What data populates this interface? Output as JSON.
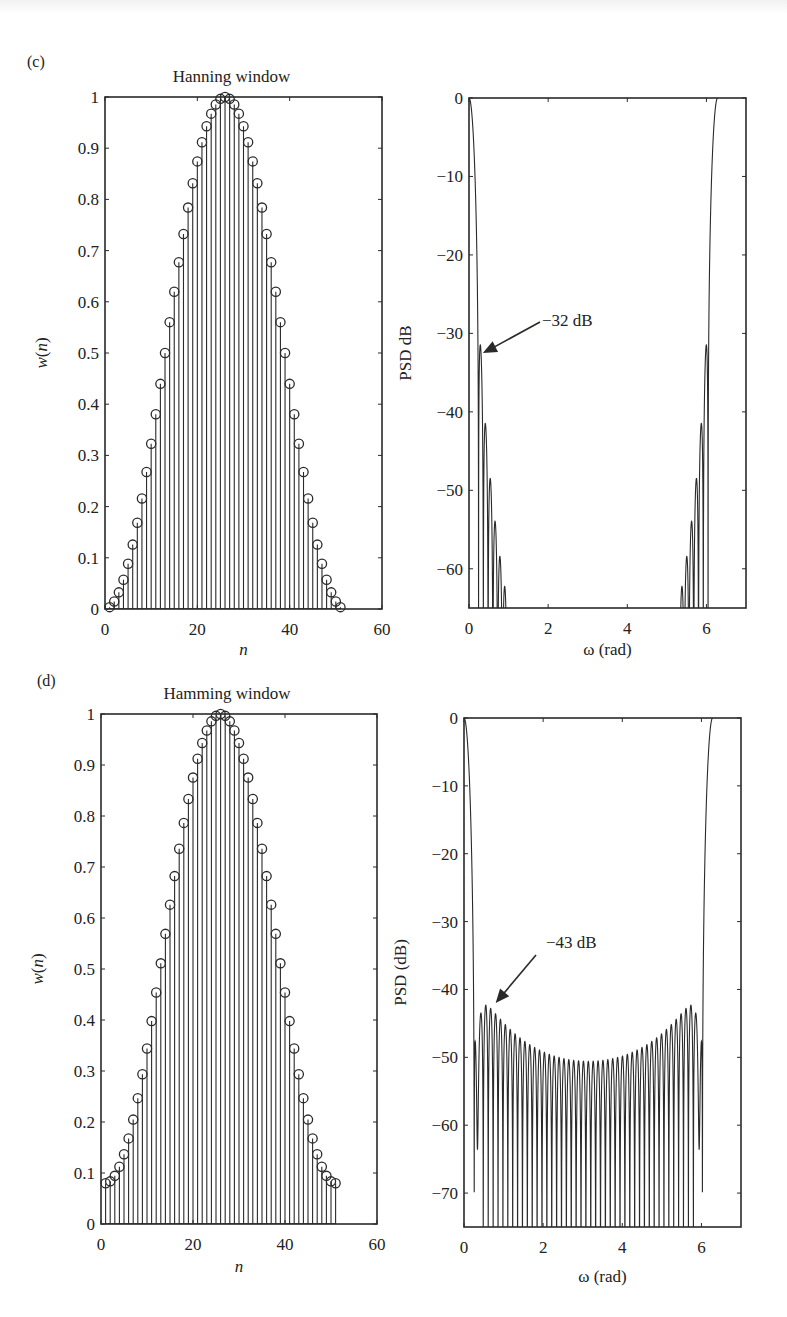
{
  "figure": {
    "panels": [
      {
        "id": "c",
        "label": "(c)"
      },
      {
        "id": "d",
        "label": "(d)"
      }
    ]
  },
  "chart_data": [
    {
      "panel": "(c)",
      "type": "stem",
      "title": "Hanning window",
      "xlabel": "n",
      "ylabel": "w(n)",
      "xlim": [
        0,
        60
      ],
      "ylim": [
        0,
        1
      ],
      "xticks": [
        0,
        20,
        40,
        60
      ],
      "yticks": [
        0,
        0.1,
        0.2,
        0.3,
        0.4,
        0.5,
        0.6,
        0.7,
        0.8,
        0.9,
        1
      ],
      "ytick_labels": [
        "0",
        "0.1",
        "0.2",
        "0.3",
        "0.4",
        "0.5",
        "0.6",
        "0.7",
        "0.8",
        "0.9",
        "1"
      ],
      "grid": false,
      "marker": "circle",
      "n_points": 51,
      "x_start": 1,
      "window": "hanning",
      "formula": "w(n) = 0.5 - 0.5*cos(2*pi*n/(N+1)), n = 1..N, N = 51",
      "peak": {
        "n": 26,
        "value": 1.0
      }
    },
    {
      "panel": "(c)",
      "type": "line",
      "title": "",
      "xlabel": "ω (rad)",
      "ylabel": "PSD dB",
      "xlim": [
        0,
        7
      ],
      "ylim": [
        -65,
        0
      ],
      "xticks": [
        0,
        2,
        4,
        6
      ],
      "yticks": [
        0,
        -10,
        -20,
        -30,
        -40,
        -50,
        -60
      ],
      "ytick_labels": [
        "0",
        "−10",
        "−20",
        "−30",
        "−40",
        "−50",
        "−60"
      ],
      "grid": false,
      "mainlobe_edges": [
        0.0,
        6.283
      ],
      "first_sidelobe_db": -32,
      "sidelobe_peaks_db": [
        -32,
        -42,
        -49,
        -54,
        -59,
        -63
      ],
      "annotation": {
        "text": "−32 dB",
        "arrow_to": [
          0.35,
          -32.5
        ]
      }
    },
    {
      "panel": "(d)",
      "type": "stem",
      "title": "Hamming window",
      "xlabel": "n",
      "ylabel": "w(n)",
      "xlim": [
        0,
        60
      ],
      "ylim": [
        0,
        1
      ],
      "xticks": [
        0,
        20,
        40,
        60
      ],
      "yticks": [
        0,
        0.1,
        0.2,
        0.3,
        0.4,
        0.5,
        0.6,
        0.7,
        0.8,
        0.9,
        1
      ],
      "ytick_labels": [
        "0",
        "0.1",
        "0.2",
        "0.3",
        "0.4",
        "0.5",
        "0.6",
        "0.7",
        "0.8",
        "0.9",
        "1"
      ],
      "grid": false,
      "marker": "circle",
      "n_points": 51,
      "x_start": 1,
      "window": "hamming",
      "formula": "w(n) = 0.54 - 0.46*cos(2*pi*(n-1)/(N-1)), n = 1..N, N = 51",
      "endpoint_value": 0.08,
      "peak": {
        "n": 26,
        "value": 1.0
      }
    },
    {
      "panel": "(d)",
      "type": "line",
      "title": "",
      "xlabel": "ω (rad)",
      "ylabel": "PSD (dB)",
      "xlim": [
        0,
        7
      ],
      "ylim": [
        -75,
        0
      ],
      "xticks": [
        0,
        2,
        4,
        6
      ],
      "yticks": [
        0,
        -10,
        -20,
        -30,
        -40,
        -50,
        -60,
        -70
      ],
      "ytick_labels": [
        "0",
        "−10",
        "−20",
        "−30",
        "−40",
        "−50",
        "−60",
        "−70"
      ],
      "grid": false,
      "mainlobe_edges": [
        0.0,
        6.283
      ],
      "first_sidelobe_db": -43,
      "sidelobe_envelope_db": {
        "near_edges": -43,
        "at_pi": -51
      },
      "annotation": {
        "text": "−43 dB",
        "arrow_to": [
          0.8,
          -42
        ]
      }
    }
  ]
}
